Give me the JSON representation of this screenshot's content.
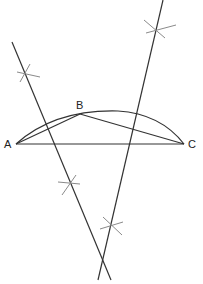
{
  "diagram": {
    "title": "",
    "colors": {
      "line": "#333333",
      "construction_mark": "#8a8a8a",
      "label": "#222222",
      "background": "#ffffff"
    },
    "points": [
      {
        "id": "A",
        "label": "A",
        "x": 16,
        "y": 144
      },
      {
        "id": "B",
        "label": "B",
        "x": 80,
        "y": 114
      },
      {
        "id": "C",
        "label": "C",
        "x": 184,
        "y": 144
      }
    ],
    "segments": [
      {
        "from": "A",
        "to": "B"
      },
      {
        "from": "B",
        "to": "C"
      },
      {
        "from": "A",
        "to": "C"
      }
    ],
    "arc": {
      "from": "A",
      "to": "C",
      "through": "B"
    },
    "bisectors": [
      {
        "name": "perpendicular bisector of AB",
        "x1": 12,
        "y1": 42,
        "x2": 111,
        "y2": 280
      },
      {
        "name": "perpendicular bisector of BC",
        "x1": 163,
        "y1": 0,
        "x2": 98,
        "y2": 280
      }
    ],
    "arc_marks": [
      {
        "x": 25,
        "y": 72
      },
      {
        "x": 70,
        "y": 185
      },
      {
        "x": 155,
        "y": 30
      },
      {
        "x": 112,
        "y": 226
      }
    ],
    "labels": {
      "A": "A",
      "B": "B",
      "C": "C"
    }
  }
}
